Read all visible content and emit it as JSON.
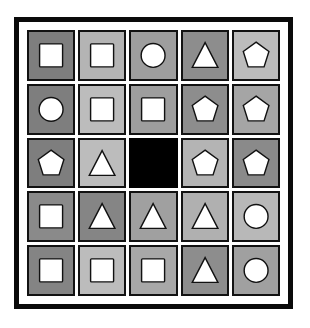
{
  "figure": {
    "kind": "matrix-reasoning-puzzle",
    "rows": 5,
    "columns": 5,
    "frame_color": "#0a0a0a",
    "page_background": "#ffffff",
    "cell_border_color": "#121212",
    "shape_fill": "#ffffff",
    "shape_outline": "#111111",
    "missing_cell_color": "#000000",
    "missing_cell": {
      "row": 3,
      "column": 3
    }
  },
  "palette": {
    "dark_gray": "#7e7e7e",
    "medium_dark_gray": "#8d8d8d",
    "medium_gray": "#9e9e9e",
    "light_medium_gray": "#adadad",
    "light_gray": "#bcbcbc",
    "black": "#000000"
  },
  "grid": {
    "cells": [
      {
        "row": 1,
        "col": 1,
        "shape": "square",
        "background": "#7e7e7e",
        "label": "white square on dark gray"
      },
      {
        "row": 1,
        "col": 2,
        "shape": "square",
        "background": "#b4b4b4",
        "label": "white square on light gray"
      },
      {
        "row": 1,
        "col": 3,
        "shape": "circle",
        "background": "#9e9e9e",
        "label": "white circle on medium gray"
      },
      {
        "row": 1,
        "col": 4,
        "shape": "triangle",
        "background": "#8d8d8d",
        "label": "white triangle on medium dark gray"
      },
      {
        "row": 1,
        "col": 5,
        "shape": "pentagon",
        "background": "#bcbcbc",
        "label": "white pentagon on light gray"
      },
      {
        "row": 2,
        "col": 1,
        "shape": "circle",
        "background": "#7e7e7e",
        "label": "white circle on dark gray"
      },
      {
        "row": 2,
        "col": 2,
        "shape": "square",
        "background": "#bcbcbc",
        "label": "white square on light gray"
      },
      {
        "row": 2,
        "col": 3,
        "shape": "square",
        "background": "#9e9e9e",
        "label": "white square on medium gray"
      },
      {
        "row": 2,
        "col": 4,
        "shape": "pentagon",
        "background": "#8d8d8d",
        "label": "white pentagon on medium dark gray"
      },
      {
        "row": 2,
        "col": 5,
        "shape": "pentagon",
        "background": "#a5a5a5",
        "label": "white pentagon on medium gray"
      },
      {
        "row": 3,
        "col": 1,
        "shape": "pentagon",
        "background": "#7e7e7e",
        "label": "white pentagon on dark gray"
      },
      {
        "row": 3,
        "col": 2,
        "shape": "triangle",
        "background": "#bcbcbc",
        "label": "white triangle on light gray"
      },
      {
        "row": 3,
        "col": 3,
        "shape": "none",
        "background": "#000000",
        "label": "solid black missing cell"
      },
      {
        "row": 3,
        "col": 4,
        "shape": "pentagon",
        "background": "#b4b4b4",
        "label": "white pentagon on light gray"
      },
      {
        "row": 3,
        "col": 5,
        "shape": "pentagon",
        "background": "#8a8a8a",
        "label": "white pentagon on dark gray"
      },
      {
        "row": 4,
        "col": 1,
        "shape": "square",
        "background": "#8a8a8a",
        "label": "white square on dark gray"
      },
      {
        "row": 4,
        "col": 2,
        "shape": "triangle",
        "background": "#858585",
        "label": "white triangle on dark gray"
      },
      {
        "row": 4,
        "col": 3,
        "shape": "triangle",
        "background": "#a0a0a0",
        "label": "white triangle on medium gray"
      },
      {
        "row": 4,
        "col": 4,
        "shape": "triangle",
        "background": "#b0b0b0",
        "label": "white triangle on light medium gray"
      },
      {
        "row": 4,
        "col": 5,
        "shape": "circle",
        "background": "#b8b8b8",
        "label": "white circle on light gray"
      },
      {
        "row": 5,
        "col": 1,
        "shape": "square",
        "background": "#848484",
        "label": "white square on dark gray"
      },
      {
        "row": 5,
        "col": 2,
        "shape": "square",
        "background": "#bcbcbc",
        "label": "white square on light gray"
      },
      {
        "row": 5,
        "col": 3,
        "shape": "square",
        "background": "#a8a8a8",
        "label": "white square on medium gray"
      },
      {
        "row": 5,
        "col": 4,
        "shape": "triangle",
        "background": "#8d8d8d",
        "label": "white triangle on medium dark gray"
      },
      {
        "row": 5,
        "col": 5,
        "shape": "circle",
        "background": "#a0a0a0",
        "label": "white circle on medium gray"
      }
    ]
  }
}
